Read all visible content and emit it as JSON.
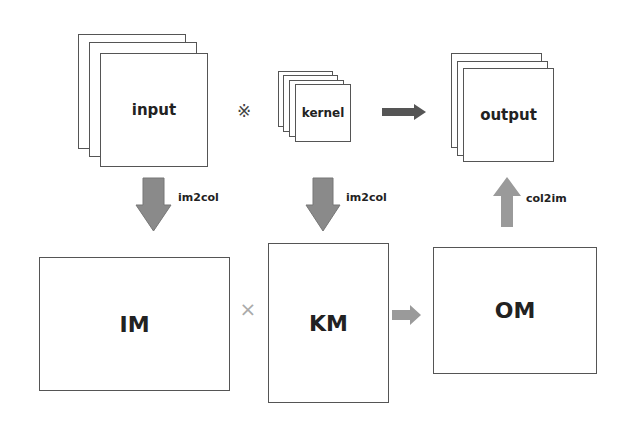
{
  "diagram": {
    "top_row": {
      "input": {
        "label": "input",
        "layers": 3
      },
      "convolution_symbol": "※",
      "kernel": {
        "label": "kernel",
        "layers": 4
      },
      "output": {
        "label": "output",
        "layers": 3
      }
    },
    "transforms": {
      "input_to_im": "im2col",
      "kernel_to_km": "im2col",
      "om_to_output": "col2im"
    },
    "bottom_row": {
      "im": {
        "label": "IM"
      },
      "multiply_symbol": "×",
      "km": {
        "label": "KM"
      },
      "om": {
        "label": "OM"
      }
    },
    "colors": {
      "dark_arrow": "#555555",
      "light_arrow": "#9a9a9a",
      "box_border": "#555555"
    }
  }
}
